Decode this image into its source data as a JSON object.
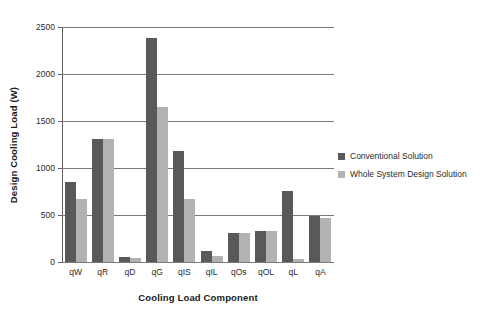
{
  "chart_data": {
    "type": "bar",
    "title": "",
    "xlabel": "Cooling Load Component",
    "ylabel": "Design Cooling Load (W)",
    "ylim": [
      0,
      2500
    ],
    "yticks": [
      0,
      500,
      1000,
      1500,
      2000,
      2500
    ],
    "ytick_labels": [
      "0",
      "500",
      "1000",
      "1500",
      "2000",
      "2500"
    ],
    "grid": true,
    "legend_position": "right",
    "categories": [
      "qW",
      "qR",
      "qD",
      "qG",
      "qIS",
      "qIL",
      "qOs",
      "qOL",
      "qL",
      "qA"
    ],
    "series": [
      {
        "name": "Conventional Solution",
        "color": "#595959",
        "values": [
          850,
          1310,
          50,
          2380,
          1180,
          120,
          305,
          330,
          760,
          490
        ]
      },
      {
        "name": "Whole System Design Solution",
        "color": "#b2b2b2",
        "values": [
          670,
          1310,
          45,
          1650,
          675,
          60,
          310,
          325,
          30,
          465
        ]
      }
    ]
  },
  "legend": {
    "items": [
      {
        "label": "Conventional Solution",
        "color": "#595959"
      },
      {
        "label": "Whole System Design Solution",
        "color": "#b2b2b2"
      }
    ]
  }
}
